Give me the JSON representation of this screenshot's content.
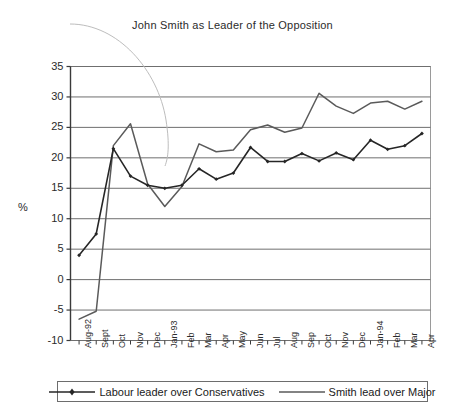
{
  "chart_data": {
    "type": "line",
    "title": "John Smith as Leader of the Opposition",
    "xlabel": "",
    "ylabel": "%",
    "ylim": [
      -10,
      35
    ],
    "ytick_step": 5,
    "yticks": [
      "35",
      "30",
      "25",
      "20",
      "15",
      "10",
      "5",
      "0",
      "-5",
      "-10"
    ],
    "ytick_values": [
      35,
      30,
      25,
      20,
      15,
      10,
      5,
      0,
      -5,
      -10
    ],
    "grid": true,
    "grid_axis": "y",
    "legend_position": "bottom",
    "categories": [
      "Aug-92",
      "Sept",
      "Oct",
      "Nov",
      "Dec",
      "Jan-93",
      "Feb",
      "Mar",
      "Apr",
      "May",
      "Jun",
      "Jul",
      "Aug",
      "Sep",
      "Oct",
      "Nov",
      "Dec",
      "Jan-94",
      "Feb",
      "Mar",
      "Apr"
    ],
    "series": [
      {
        "name": "Labour leader over Conservatives",
        "color": "#262626",
        "marker": "diamond",
        "values": [
          4.0,
          7.5,
          21.5,
          17.0,
          15.5,
          15.0,
          15.5,
          18.2,
          16.5,
          17.5,
          21.7,
          19.4,
          19.4,
          20.7,
          19.5,
          20.8,
          19.7,
          22.9,
          21.4,
          22.0,
          24.0
        ]
      },
      {
        "name": "Smith lead over Major",
        "color": "#5a5a5a",
        "marker": "none",
        "values": [
          -6.5,
          -5.2,
          22.0,
          25.6,
          15.7,
          12.0,
          15.3,
          22.3,
          21.0,
          21.3,
          24.6,
          25.4,
          24.2,
          24.9,
          30.6,
          28.5,
          27.3,
          29.0,
          29.3,
          28.0,
          29.3
        ]
      }
    ],
    "annotations": [
      {
        "name": "ellipse-arc",
        "kind": "arc",
        "color": "#b8b8b8"
      }
    ]
  },
  "legend": {
    "entries": [
      {
        "label": "Labour leader over Conservatives"
      },
      {
        "label": "Smith lead over Major"
      }
    ]
  },
  "axis_unit": "%"
}
